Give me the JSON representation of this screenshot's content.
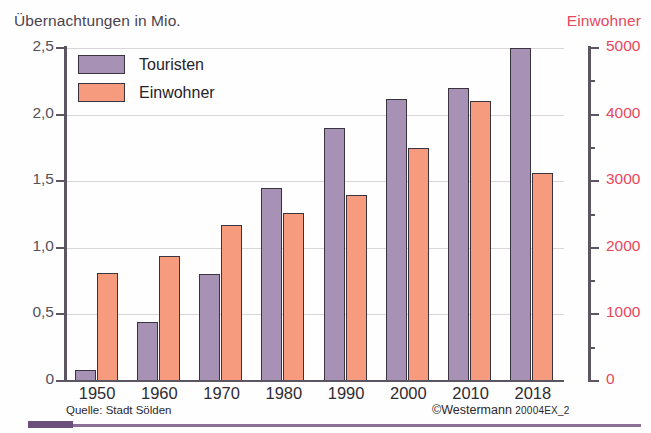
{
  "axis_title_left": "Übernachtungen in Mio.",
  "axis_title_right": "Einwohner",
  "legend": [
    {
      "label": "Touristen",
      "color": "#a791b4",
      "key": "touristen"
    },
    {
      "label": "Einwohner",
      "color": "#f79b7e",
      "key": "einwohner"
    }
  ],
  "footer": {
    "source": "Quelle: Stadt Sölden",
    "copyright_symbol": "©",
    "copyright_name": "Westermann",
    "copyright_code": "20004EX_2"
  },
  "left_axis": {
    "label": "Übernachtungen in Mio.",
    "ticks": [
      "0",
      "0,5",
      "1,0",
      "1,5",
      "2,0",
      "2,5"
    ],
    "values": [
      0,
      0.5,
      1.0,
      1.5,
      2.0,
      2.5
    ],
    "min": 0,
    "max": 2.5,
    "color": "#56505c"
  },
  "right_axis": {
    "label": "Einwohner",
    "ticks": [
      "0",
      "1000",
      "2000",
      "3000",
      "4000",
      "5000"
    ],
    "values": [
      0,
      1000,
      2000,
      3000,
      4000,
      5000
    ],
    "minor_values": [
      500,
      1500,
      2500,
      3500,
      4500
    ],
    "min": 0,
    "max": 5000,
    "color": "#e8475c"
  },
  "chart_data": {
    "type": "bar",
    "title": "Übernachtungen in Mio.",
    "subtitle": "",
    "xlabel": "",
    "ylabel": "Übernachtungen in Mio.",
    "ylabel_secondary": "Einwohner",
    "ylim": [
      0,
      2.5
    ],
    "ylim_secondary": [
      0,
      5000
    ],
    "grid": true,
    "legend_position": "top-left",
    "categories": [
      "1950",
      "1960",
      "1970",
      "1980",
      "1990",
      "2000",
      "2010",
      "2018"
    ],
    "series": [
      {
        "name": "Touristen",
        "axis": "left",
        "unit": "Mio. Übernachtungen",
        "color": "#a791b4",
        "values": [
          0.08,
          0.44,
          0.8,
          1.45,
          1.9,
          2.12,
          2.2,
          2.5
        ]
      },
      {
        "name": "Einwohner",
        "axis": "right",
        "unit": "Einwohner",
        "color": "#f79b7e",
        "values": [
          1620,
          1870,
          2340,
          2520,
          2800,
          3500,
          4200,
          3130
        ]
      }
    ],
    "source": "Quelle: Stadt Sölden",
    "copyright": "©Westermann 20004EX_2"
  }
}
